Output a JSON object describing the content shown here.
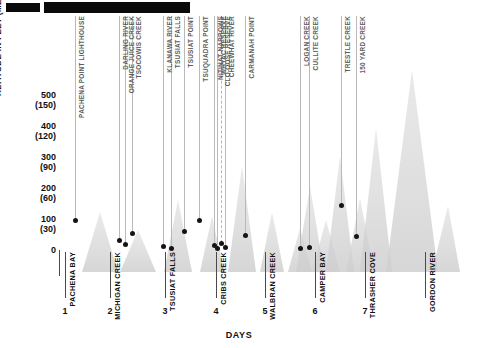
{
  "title_redacted": true,
  "chart_data": {
    "type": "scatter",
    "title": "",
    "xlabel": "DAYS",
    "ylabel": "ALTITUDE IN FEET (METRES )",
    "ylim": [
      0,
      550
    ],
    "xlim": [
      0,
      8
    ],
    "grid": false,
    "legend": null,
    "y_ticks": [
      {
        "feet": "500",
        "metres": "(150)",
        "value": 500
      },
      {
        "feet": "400",
        "metres": "(120)",
        "value": 400
      },
      {
        "feet": "300",
        "metres": "(90)",
        "value": 300
      },
      {
        "feet": "200",
        "metres": "(60)",
        "value": 200
      },
      {
        "feet": "100",
        "metres": "(30)",
        "value": 100
      },
      {
        "feet": "0",
        "metres": "",
        "value": 0
      }
    ],
    "x_ticks": [
      "1",
      "2",
      "3",
      "4",
      "5",
      "6",
      "7"
    ],
    "day_camps": [
      {
        "day": "1",
        "name": "Pachena Bay"
      },
      {
        "day": "2",
        "name": "Michigan Creek"
      },
      {
        "day": "3",
        "name": "Tsusiat Falls"
      },
      {
        "day": "4",
        "name": "Cribs Creek"
      },
      {
        "day": "5",
        "name": "Walbran Creek"
      },
      {
        "day": "6",
        "name": "Camper Bay"
      },
      {
        "day": "7",
        "name": "Thrasher Cove"
      },
      {
        "day": "",
        "name": "Gordon River"
      }
    ],
    "points": [
      {
        "label": "Pachena Point Lighthouse",
        "x": 0.3,
        "y": 95,
        "dashed": false
      },
      {
        "label": "Darling River",
        "x": 1.18,
        "y": 30,
        "dashed": false
      },
      {
        "label": "Orange Juice Creek",
        "x": 1.3,
        "y": 17,
        "dashed": false
      },
      {
        "label": "Tsocowis Creek",
        "x": 1.44,
        "y": 52,
        "dashed": false
      },
      {
        "label": "Klanawa River",
        "x": 2.06,
        "y": 12,
        "dashed": false
      },
      {
        "label": "Tsusiat Falls",
        "x": 2.22,
        "y": 5,
        "dashed": false
      },
      {
        "label": "Tsusiat Point",
        "x": 2.48,
        "y": 60,
        "dashed": false
      },
      {
        "label": "Tsuquadra Point",
        "x": 2.78,
        "y": 95,
        "dashed": false
      },
      {
        "label": "Nitinat Narrows",
        "x": 3.08,
        "y": 14,
        "dashed": false
      },
      {
        "label": "Whyac Reserve",
        "x": 3.14,
        "y": 5,
        "dashed": false
      },
      {
        "label": "Clo-oose Reserve",
        "x": 3.22,
        "y": 22,
        "dashed": true
      },
      {
        "label": "Cheewhat River",
        "x": 3.3,
        "y": 9,
        "dashed": false
      },
      {
        "label": "Carmanah Point",
        "x": 3.7,
        "y": 48,
        "dashed": false
      },
      {
        "label": "Logan Creek",
        "x": 4.8,
        "y": 4,
        "dashed": false
      },
      {
        "label": "Cullite Creek",
        "x": 4.98,
        "y": 7,
        "dashed": false
      },
      {
        "label": "Trestle Creek",
        "x": 5.62,
        "y": 145,
        "dashed": false
      },
      {
        "label": "150 Yard Creek",
        "x": 5.92,
        "y": 42,
        "dashed": false
      }
    ]
  }
}
